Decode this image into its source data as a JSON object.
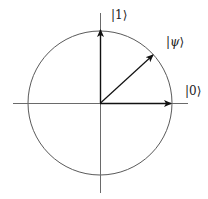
{
  "diagram": {
    "type": "qubit-state-circle",
    "center": [
      100,
      103
    ],
    "radius": 72,
    "axis_color": "#6a6a6a",
    "circle_color": "#5a5a5a",
    "arrow_color": "#111111",
    "axes": {
      "horizontal": {
        "x1": 13,
        "x2": 188,
        "y": 103
      },
      "vertical": {
        "x": 100,
        "y1": 13,
        "y2": 193
      }
    },
    "vectors": [
      {
        "name": "ket-0",
        "label": "|0⟩",
        "tip": [
          171,
          103
        ]
      },
      {
        "name": "ket-1",
        "label": "|1⟩",
        "tip": [
          100,
          30
        ]
      },
      {
        "name": "ket-psi",
        "label": "|ψ⟩",
        "tip": [
          153,
          55
        ]
      }
    ],
    "labels": {
      "ket_0": {
        "prefix": "|",
        "body": "0",
        "suffix": "⟩"
      },
      "ket_1": {
        "prefix": "|",
        "body": "1",
        "suffix": "⟩"
      },
      "ket_psi": {
        "prefix": "|",
        "body": "ψ",
        "suffix": "⟩"
      }
    }
  }
}
